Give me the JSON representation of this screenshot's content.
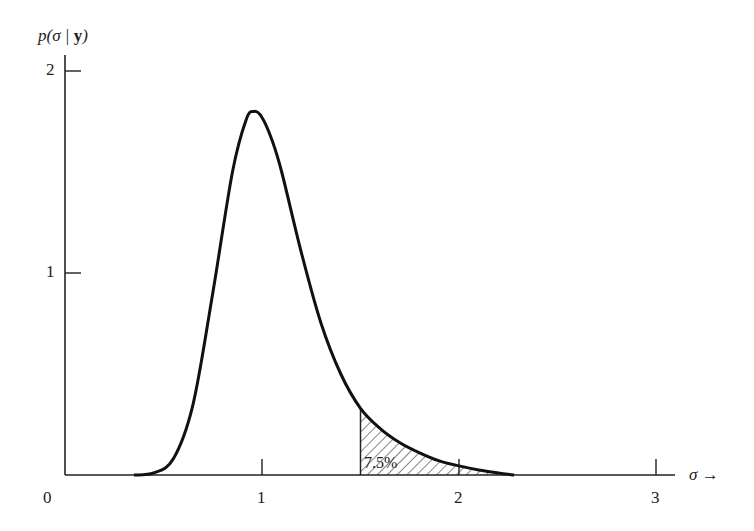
{
  "chart_data": {
    "type": "line",
    "title": "",
    "xlabel": "σ →",
    "ylabel": "p(σ|y)",
    "ylabel_parts": {
      "pre": "p(σ | ",
      "bold": "y",
      "post": ")"
    },
    "xlim": [
      0,
      3
    ],
    "ylim": [
      0,
      2
    ],
    "grid": false,
    "x_ticks": [
      {
        "value": 1,
        "label": "1"
      },
      {
        "value": 2,
        "label": "2"
      },
      {
        "value": 3,
        "label": "3"
      }
    ],
    "origin_label": "0",
    "y_ticks": [
      {
        "value": 1,
        "label": "1"
      },
      {
        "value": 2,
        "label": "2"
      }
    ],
    "series": [
      {
        "name": "posterior density p(σ|y)",
        "x": [
          0.35,
          0.45,
          0.55,
          0.65,
          0.75,
          0.85,
          0.92,
          0.96,
          1.0,
          1.05,
          1.1,
          1.2,
          1.3,
          1.4,
          1.5,
          1.6,
          1.7,
          1.8,
          1.9,
          2.0,
          2.1,
          2.2,
          2.28
        ],
        "y": [
          0.0,
          0.01,
          0.08,
          0.35,
          0.9,
          1.5,
          1.76,
          1.8,
          1.77,
          1.66,
          1.5,
          1.1,
          0.75,
          0.5,
          0.33,
          0.23,
          0.16,
          0.11,
          0.07,
          0.045,
          0.025,
          0.01,
          0.0
        ]
      }
    ],
    "shaded_region": {
      "from": 1.5,
      "to": 2.28,
      "pattern": "hatched",
      "label": "7.5%"
    }
  }
}
